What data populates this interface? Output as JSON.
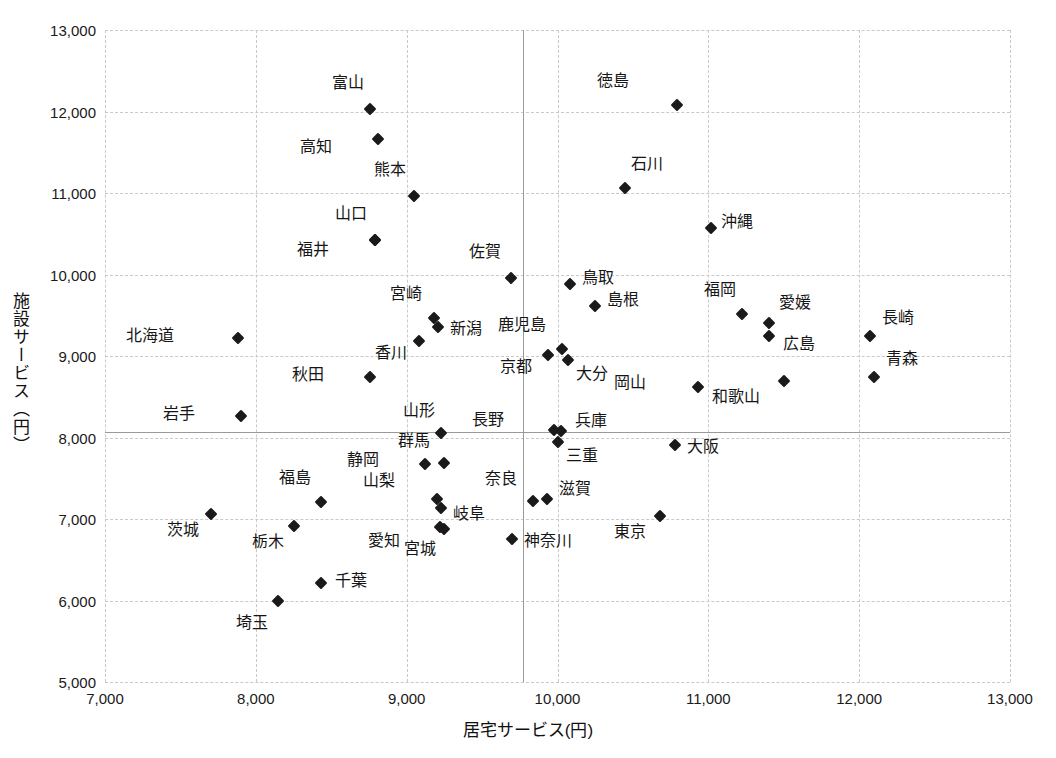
{
  "chart_data": {
    "type": "scatter",
    "title": "",
    "xlabel": "居宅サービス(円)",
    "ylabel": "施設サービス（円）",
    "xlim": [
      7000,
      13000
    ],
    "ylim": [
      5000,
      13000
    ],
    "xticks": [
      "7,000",
      "8,000",
      "9,000",
      "10,000",
      "11,000",
      "12,000",
      "13,000"
    ],
    "yticks": [
      "5,000",
      "6,000",
      "7,000",
      "8,000",
      "9,000",
      "10,000",
      "11,000",
      "12,000",
      "13,000"
    ],
    "xtick_values": [
      7000,
      8000,
      9000,
      10000,
      11000,
      12000,
      13000
    ],
    "ytick_values": [
      5000,
      6000,
      7000,
      8000,
      9000,
      10000,
      11000,
      12000,
      13000
    ],
    "grid": "dashed both axes",
    "legend": "none",
    "marker": "filled diamond",
    "marker_color": "#1a1a1a",
    "reference_lines": {
      "vertical_x": 9770,
      "horizontal_y": 8070,
      "style": "solid gray"
    },
    "points": [
      {
        "label": "富山",
        "x": 8760,
        "y": 12030,
        "lx": -6,
        "ly": -26
      },
      {
        "label": "高知",
        "x": 8810,
        "y": 11660,
        "lx": -46,
        "ly": 8
      },
      {
        "label": "徳島",
        "x": 10790,
        "y": 12080,
        "lx": -48,
        "ly": -24
      },
      {
        "label": "熊本",
        "x": 9050,
        "y": 10960,
        "lx": -8,
        "ly": -26
      },
      {
        "label": "石川",
        "x": 10450,
        "y": 11060,
        "lx": 6,
        "ly": -24
      },
      {
        "label": "山口",
        "x": 8790,
        "y": 10420,
        "lx": -8,
        "ly": -26
      },
      {
        "label": "福井",
        "x": 8790,
        "y": 10420,
        "lx": -46,
        "ly": 10
      },
      {
        "label": "沖縄",
        "x": 11020,
        "y": 10570,
        "lx": 10,
        "ly": -6
      },
      {
        "label": "佐賀",
        "x": 9690,
        "y": 9960,
        "lx": -10,
        "ly": -26
      },
      {
        "label": "鳥取",
        "x": 10080,
        "y": 9880,
        "lx": 12,
        "ly": -6
      },
      {
        "label": "島根",
        "x": 10250,
        "y": 9610,
        "lx": 12,
        "ly": -6
      },
      {
        "label": "福岡",
        "x": 11220,
        "y": 9520,
        "lx": -6,
        "ly": -24
      },
      {
        "label": "宮崎",
        "x": 9180,
        "y": 9470,
        "lx": -12,
        "ly": -24
      },
      {
        "label": "愛媛",
        "x": 11400,
        "y": 9400,
        "lx": 10,
        "ly": -20
      },
      {
        "label": "新潟",
        "x": 9210,
        "y": 9360,
        "lx": 12,
        "ly": 2
      },
      {
        "label": "長崎",
        "x": 12070,
        "y": 9250,
        "lx": 12,
        "ly": -18
      },
      {
        "label": "広島",
        "x": 11400,
        "y": 9250,
        "lx": 14,
        "ly": 8
      },
      {
        "label": "北海道",
        "x": 7880,
        "y": 9220,
        "lx": -64,
        "ly": -2
      },
      {
        "label": "香川",
        "x": 9080,
        "y": 9190,
        "lx": -12,
        "ly": 12
      },
      {
        "label": "鹿児島",
        "x": 10030,
        "y": 9080,
        "lx": -16,
        "ly": -24
      },
      {
        "label": "京都",
        "x": 9940,
        "y": 9010,
        "lx": -16,
        "ly": 12
      },
      {
        "label": "大分",
        "x": 10070,
        "y": 8950,
        "lx": 8,
        "ly": 14
      },
      {
        "label": "秋田",
        "x": 8760,
        "y": 8740,
        "lx": -46,
        "ly": -2
      },
      {
        "label": "青森",
        "x": 12100,
        "y": 8740,
        "lx": 12,
        "ly": -18
      },
      {
        "label": "和歌山",
        "x": 11500,
        "y": 8690,
        "lx": -24,
        "ly": 16
      },
      {
        "label": "岡山",
        "x": 10930,
        "y": 8620,
        "lx": -52,
        "ly": -4
      },
      {
        "label": "岩手",
        "x": 7900,
        "y": 8260,
        "lx": -46,
        "ly": -2
      },
      {
        "label": "山形",
        "x": 9230,
        "y": 8050,
        "lx": -6,
        "ly": -22
      },
      {
        "label": "長野",
        "x": 9980,
        "y": 8090,
        "lx": -50,
        "ly": -10
      },
      {
        "label": "兵庫",
        "x": 10020,
        "y": 8080,
        "lx": 14,
        "ly": -10
      },
      {
        "label": "三重",
        "x": 10000,
        "y": 7950,
        "lx": 8,
        "ly": 14
      },
      {
        "label": "大阪",
        "x": 10780,
        "y": 7910,
        "lx": 12,
        "ly": 2
      },
      {
        "label": "群馬",
        "x": 9250,
        "y": 7690,
        "lx": -14,
        "ly": -22
      },
      {
        "label": "静岡",
        "x": 9120,
        "y": 7680,
        "lx": -46,
        "ly": -4
      },
      {
        "label": "山梨",
        "x": 9200,
        "y": 7250,
        "lx": -42,
        "ly": -18
      },
      {
        "label": "滋賀",
        "x": 9930,
        "y": 7240,
        "lx": 12,
        "ly": -10
      },
      {
        "label": "奈良",
        "x": 9840,
        "y": 7220,
        "lx": -16,
        "ly": -22
      },
      {
        "label": "福島",
        "x": 8430,
        "y": 7210,
        "lx": -10,
        "ly": -24
      },
      {
        "label": "岐阜",
        "x": 9230,
        "y": 7140,
        "lx": 12,
        "ly": 6
      },
      {
        "label": "東京",
        "x": 10680,
        "y": 7040,
        "lx": -14,
        "ly": 16
      },
      {
        "label": "茨城",
        "x": 7700,
        "y": 7060,
        "lx": -12,
        "ly": 16
      },
      {
        "label": "愛知",
        "x": 9220,
        "y": 6900,
        "lx": -40,
        "ly": 14
      },
      {
        "label": "栃木",
        "x": 8250,
        "y": 6910,
        "lx": -10,
        "ly": 16
      },
      {
        "label": "宮城",
        "x": 9250,
        "y": 6880,
        "lx": -8,
        "ly": 20
      },
      {
        "label": "神奈川",
        "x": 9700,
        "y": 6760,
        "lx": 12,
        "ly": 2
      },
      {
        "label": "千葉",
        "x": 8430,
        "y": 6210,
        "lx": 14,
        "ly": -2
      },
      {
        "label": "埼玉",
        "x": 8150,
        "y": 5990,
        "lx": -10,
        "ly": 22
      }
    ]
  }
}
